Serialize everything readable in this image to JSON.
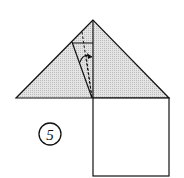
{
  "diagram": {
    "type": "origami-fold-step",
    "step_number": "5",
    "colors": {
      "line": "#111111",
      "fill_shaded": "#d6d6d6",
      "paper": "#ffffff"
    },
    "shapes": {
      "triangle": {
        "apex": [
          93,
          20
        ],
        "left": [
          16,
          98
        ],
        "right": [
          169,
          98
        ]
      },
      "square": {
        "x": 93,
        "y": 98,
        "width": 76,
        "height": 78
      },
      "fold_edge": {
        "from": [
          72,
          42
        ],
        "to": [
          92,
          98
        ]
      },
      "crease_horizontal": {
        "from": [
          72,
          43
        ],
        "to": [
          93,
          43
        ]
      },
      "valley_fold_dashed": {
        "from": [
          82,
          32
        ],
        "to": [
          92,
          98
        ]
      },
      "center_line": {
        "from": [
          93,
          20
        ],
        "to": [
          93,
          98
        ]
      }
    }
  }
}
